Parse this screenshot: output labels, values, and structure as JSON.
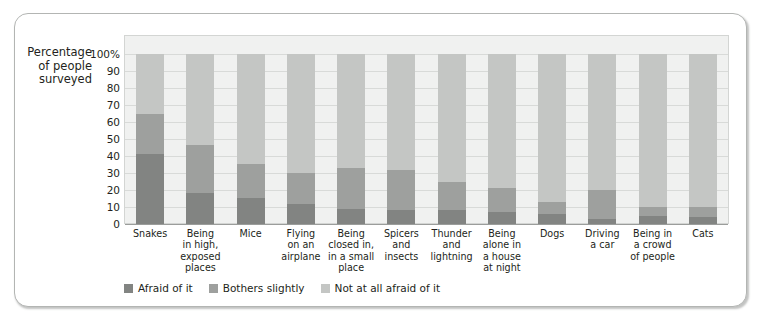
{
  "figure": {
    "y_axis_title": [
      "Percentage",
      "of people",
      "surveyed"
    ],
    "legend": [
      {
        "label": "Afraid of it",
        "color": "#828482",
        "key": "afraid"
      },
      {
        "label": "Bothers slightly",
        "color": "#9ea09e",
        "key": "bothers"
      },
      {
        "label": "Not at all afraid of it",
        "color": "#c4c6c4",
        "key": "not_afraid"
      }
    ]
  },
  "chart_data": {
    "type": "bar",
    "subtype": "stacked-100-percent",
    "title": "",
    "xlabel": "",
    "ylabel": "Percentage of people surveyed",
    "ylim": [
      0,
      100
    ],
    "grid": true,
    "legend_position": "bottom-left",
    "ytick_labels": [
      "100%",
      "90",
      "80",
      "70",
      "60",
      "50",
      "40",
      "30",
      "20",
      "10",
      "0"
    ],
    "ytick_values": [
      100,
      90,
      80,
      70,
      60,
      50,
      40,
      30,
      20,
      10,
      0
    ],
    "categories": [
      "Snakes",
      "Being in high, exposed places",
      "Mice",
      "Flying on an airplane",
      "Being closed in, in a small place",
      "Spicers and insects",
      "Thunder and lightning",
      "Being alone in a house at night",
      "Dogs",
      "Driving a car",
      "Being in a crowd of people",
      "Cats"
    ],
    "category_lines": [
      [
        "Snakes"
      ],
      [
        "Being",
        "in high,",
        "exposed",
        "places"
      ],
      [
        "Mice"
      ],
      [
        "Flying",
        "on an",
        "airplane"
      ],
      [
        "Being",
        "closed in,",
        "in a small",
        "place"
      ],
      [
        "Spicers",
        "and",
        "insects"
      ],
      [
        "Thunder",
        "and",
        "lightning"
      ],
      [
        "Being",
        "alone in",
        "a house",
        "at night"
      ],
      [
        "Dogs"
      ],
      [
        "Driving",
        "a car"
      ],
      [
        "Being in",
        "a crowd",
        "of people"
      ],
      [
        "Cats"
      ]
    ],
    "series": [
      {
        "name": "Afraid of it",
        "color": "#828482",
        "values": [
          41,
          18.5,
          15.5,
          12,
          9,
          8.5,
          8.5,
          7,
          6,
          3,
          4.5,
          4
        ]
      },
      {
        "name": "Bothers slightly",
        "color": "#9ea09e",
        "values": [
          24,
          28,
          20,
          18,
          24,
          23,
          16.5,
          14,
          7,
          17,
          5.5,
          6
        ]
      },
      {
        "name": "Not at all afraid of it",
        "color": "#c4c6c4",
        "values": [
          35,
          53.5,
          64.5,
          70,
          67,
          68.5,
          75,
          79,
          87,
          80,
          90,
          90
        ]
      }
    ],
    "cumulative_tops": {
      "afraid": [
        41,
        18.5,
        15.5,
        12,
        9,
        8.5,
        8.5,
        7,
        6,
        3,
        4.5,
        4
      ],
      "afraid_plus_bothers": [
        65,
        46.5,
        35.5,
        30,
        33,
        31.5,
        25,
        21,
        13,
        20,
        10,
        10
      ]
    }
  }
}
